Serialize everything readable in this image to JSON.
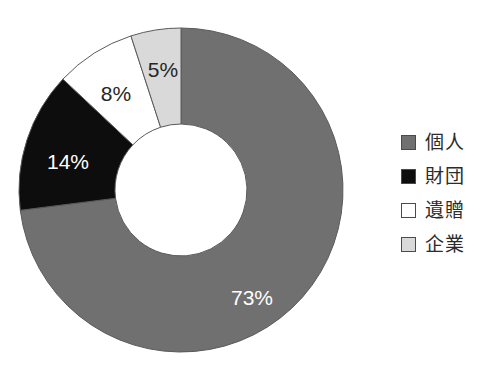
{
  "chart_data": {
    "type": "pie",
    "variant": "donut",
    "title": "",
    "subtitle": "",
    "xlabel": "",
    "ylabel": "",
    "grid": false,
    "legend_position": "right",
    "start_angle_deg": 0,
    "direction": "clockwise",
    "hole_ratio": 0.41,
    "categories": [
      "個人",
      "財団",
      "遺贈",
      "企業"
    ],
    "values": [
      73,
      14,
      8,
      5
    ],
    "value_unit": "%",
    "data_labels": [
      "73%",
      "14%",
      "8%",
      "5%"
    ],
    "slices": [
      {
        "label": "個人",
        "value": 73,
        "data_label": "73%",
        "color": "#707070",
        "label_color": "#ffffff",
        "label_x": 252,
        "label_y": 299
      },
      {
        "label": "財団",
        "value": 14,
        "data_label": "14%",
        "color": "#0d0d0d",
        "label_color": "#ffffff",
        "label_x": 68,
        "label_y": 163
      },
      {
        "label": "遺贈",
        "value": 8,
        "data_label": "8%",
        "color": "#ffffff",
        "label_color": "#262626",
        "label_x": 116,
        "label_y": 95
      },
      {
        "label": "企業",
        "value": 5,
        "data_label": "5%",
        "color": "#d9d9d9",
        "label_color": "#262626",
        "label_x": 163,
        "label_y": 71
      }
    ],
    "geometry": {
      "center_x": 181,
      "center_y": 190,
      "outer_radius": 162,
      "inner_radius": 66,
      "stroke_color": "#5a5a5a",
      "stroke_width": 1
    }
  },
  "legend": {
    "items": [
      {
        "label": "個人",
        "swatch_color": "#707070",
        "icon": "legend-swatch-icon"
      },
      {
        "label": "財団",
        "swatch_color": "#0d0d0d",
        "icon": "legend-swatch-icon"
      },
      {
        "label": "遺贈",
        "swatch_color": "#ffffff",
        "icon": "legend-swatch-icon"
      },
      {
        "label": "企業",
        "swatch_color": "#d9d9d9",
        "icon": "legend-swatch-icon"
      }
    ]
  },
  "colors": {
    "background": "#ffffff",
    "individual": "#707070",
    "foundation": "#0d0d0d",
    "bequest": "#ffffff",
    "corporate": "#d9d9d9",
    "outline": "#5a5a5a",
    "text": "#2b2b2b"
  }
}
